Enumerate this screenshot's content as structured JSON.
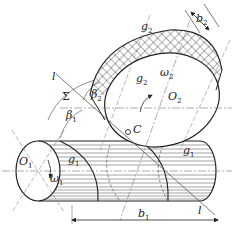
{
  "diagram": {
    "colors": {
      "line": "#222222",
      "thin": "#555555",
      "dash": "#777777",
      "background": "#ffffff"
    },
    "labels": {
      "l_top": {
        "base": "l",
        "sub": ""
      },
      "sigma": {
        "base": "Σ",
        "sub": ""
      },
      "beta1": {
        "base": "β",
        "sub": "1"
      },
      "beta2": {
        "base": "β",
        "sub": "2"
      },
      "g2_top": {
        "base": "g",
        "sub": "2"
      },
      "g2_mid": {
        "base": "g",
        "sub": "2"
      },
      "b2": {
        "base": "b",
        "sub": "2"
      },
      "omega2": {
        "base": "ω",
        "sub": "2"
      },
      "O2": {
        "base": "O",
        "sub": "2"
      },
      "O1": {
        "base": "O",
        "sub": "1"
      },
      "g1_left": {
        "base": "g",
        "sub": "1"
      },
      "omega1": {
        "base": "ω",
        "sub": "1"
      },
      "C": {
        "base": "C",
        "sub": ""
      },
      "g1_right": {
        "base": "g",
        "sub": "1"
      },
      "l_bottom": {
        "base": "l",
        "sub": ""
      },
      "b1": {
        "base": "b",
        "sub": "1"
      }
    }
  }
}
